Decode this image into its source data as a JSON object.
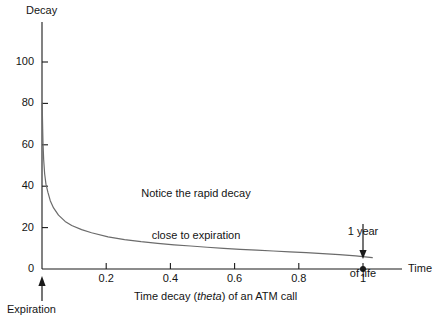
{
  "chart_data": {
    "type": "line",
    "title": "",
    "xlabel": "Time",
    "ylabel": "Decay",
    "caption": "Time decay (theta) of an ATM call",
    "caption_parts": {
      "before": "Time decay (",
      "italic": "theta",
      "after": ") of an ATM call"
    },
    "xlim": [
      0,
      1.09
    ],
    "ylim": [
      0,
      112
    ],
    "xticks": [
      0.2,
      0.4,
      0.6,
      0.8,
      1
    ],
    "xtick_labels": [
      "0.2",
      "0.4",
      "0.6",
      "0.8",
      "1"
    ],
    "yticks": [
      0,
      20,
      40,
      60,
      80,
      100
    ],
    "ytick_labels": [
      "0",
      "20",
      "40",
      "60",
      "80",
      "100"
    ],
    "grid": false,
    "legend": "none",
    "series": [
      {
        "name": "ATM call theta decay",
        "x": [
          0.0005,
          0.001,
          0.002,
          0.003,
          0.005,
          0.008,
          0.012,
          0.018,
          0.025,
          0.035,
          0.05,
          0.07,
          0.09,
          0.12,
          0.15,
          0.2,
          0.25,
          0.3,
          0.35,
          0.4,
          0.45,
          0.5,
          0.55,
          0.6,
          0.65,
          0.7,
          0.75,
          0.8,
          0.85,
          0.9,
          0.95,
          1.0
        ],
        "y": [
          80,
          76,
          68,
          61,
          53,
          46,
          41,
          37,
          33,
          29.5,
          26,
          23,
          21,
          19,
          17.5,
          15.5,
          14.2,
          13.2,
          12.4,
          11.7,
          11.1,
          10.5,
          10.0,
          9.5,
          9.1,
          8.7,
          8.3,
          7.9,
          7.4,
          6.9,
          6.3,
          5.5
        ]
      }
    ],
    "markers": [
      {
        "name": "one-year-point",
        "x": 1,
        "y": 0,
        "label": "1 year\nof life"
      }
    ],
    "annotations": [
      {
        "name": "rapid-decay-note",
        "line1": "Notice the rapid decay",
        "line2": "close to expiration"
      },
      {
        "name": "one-year-of-life",
        "line1": "1 year",
        "line2": "of life"
      },
      {
        "name": "expiration",
        "line1": "Expiration"
      }
    ],
    "colors": {
      "curve": "#6b6b6b",
      "axis": "#1a1a1a",
      "text": "#141414",
      "background": "#ffffff",
      "marker": "#1a1a1a"
    }
  },
  "axes": {
    "y_title": "Decay",
    "x_title": "Time"
  },
  "ticks": {
    "y": [
      "100",
      "80",
      "60",
      "40",
      "20",
      "0"
    ],
    "x": [
      "0.2",
      "0.4",
      "0.6",
      "0.8",
      "1"
    ]
  },
  "annotations": {
    "note_line1": "Notice the rapid decay",
    "note_line2": "close to expiration",
    "year_line1": "1 year",
    "year_line2": "of life",
    "expiration": "Expiration"
  },
  "caption": {
    "before": "Time decay (",
    "italic": "theta",
    "after": ") of an ATM call"
  }
}
